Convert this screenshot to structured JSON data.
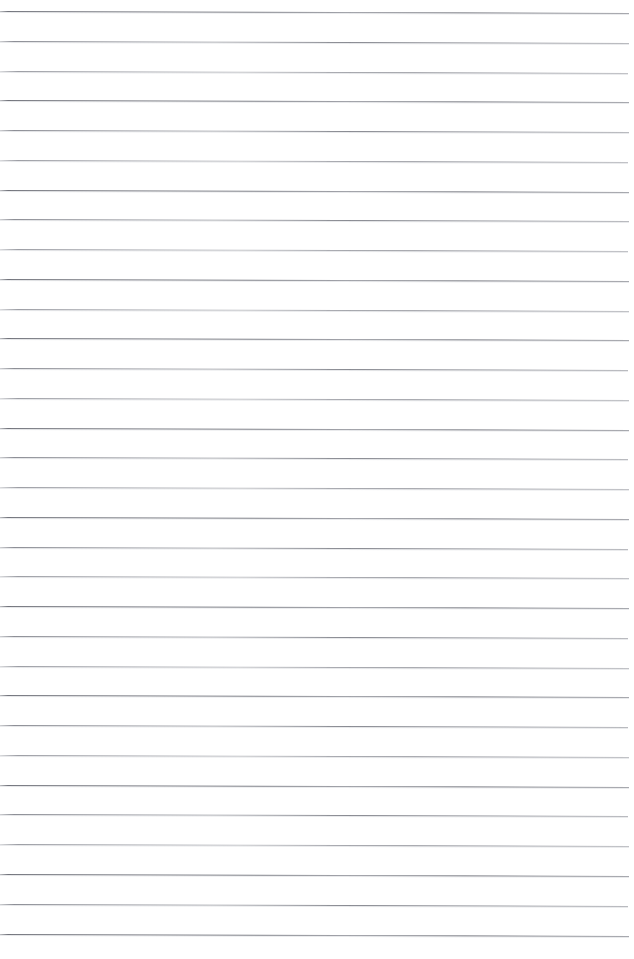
{
  "page": {
    "kind": "lined-paper-scan",
    "width": 634,
    "height": 959,
    "background_color": "#ffffff",
    "has_text": false,
    "note": ""
  },
  "ruling": {
    "line_color": "#808289",
    "line_count": 32,
    "spacing_px": 30,
    "first_line_y": 11,
    "last_line_y": 949,
    "line_start_x": 0,
    "line_end_x": 629,
    "line_thickness_px": 1,
    "tilt_px_across_width": 2,
    "lines": [
      {
        "y": 11,
        "x_start": 0,
        "x_end": 629,
        "variant": "var-b"
      },
      {
        "y": 41,
        "x_start": 0,
        "x_end": 629,
        "variant": "var-a"
      },
      {
        "y": 71,
        "x_start": 0,
        "x_end": 628,
        "variant": "var-c"
      },
      {
        "y": 100,
        "x_start": 0,
        "x_end": 629,
        "variant": "var-b"
      },
      {
        "y": 130,
        "x_start": 0,
        "x_end": 629,
        "variant": "var-a"
      },
      {
        "y": 160,
        "x_start": 0,
        "x_end": 628,
        "variant": "var-c"
      },
      {
        "y": 190,
        "x_start": 0,
        "x_end": 629,
        "variant": "var-b"
      },
      {
        "y": 219,
        "x_start": 0,
        "x_end": 629,
        "variant": "var-a"
      },
      {
        "y": 249,
        "x_start": 0,
        "x_end": 628,
        "variant": "var-c"
      },
      {
        "y": 279,
        "x_start": 0,
        "x_end": 629,
        "variant": "var-b"
      },
      {
        "y": 309,
        "x_start": 0,
        "x_end": 629,
        "variant": "var-c"
      },
      {
        "y": 338,
        "x_start": 0,
        "x_end": 629,
        "variant": "var-b"
      },
      {
        "y": 368,
        "x_start": 0,
        "x_end": 628,
        "variant": "var-a"
      },
      {
        "y": 398,
        "x_start": 0,
        "x_end": 629,
        "variant": "var-c"
      },
      {
        "y": 428,
        "x_start": 0,
        "x_end": 629,
        "variant": "var-b"
      },
      {
        "y": 457,
        "x_start": 0,
        "x_end": 628,
        "variant": "var-a"
      },
      {
        "y": 487,
        "x_start": 0,
        "x_end": 629,
        "variant": "var-c"
      },
      {
        "y": 517,
        "x_start": 0,
        "x_end": 629,
        "variant": "var-b"
      },
      {
        "y": 547,
        "x_start": 0,
        "x_end": 628,
        "variant": "var-a"
      },
      {
        "y": 576,
        "x_start": 0,
        "x_end": 629,
        "variant": "var-c"
      },
      {
        "y": 606,
        "x_start": 0,
        "x_end": 629,
        "variant": "var-b"
      },
      {
        "y": 636,
        "x_start": 0,
        "x_end": 628,
        "variant": "var-a"
      },
      {
        "y": 666,
        "x_start": 0,
        "x_end": 629,
        "variant": "var-c"
      },
      {
        "y": 695,
        "x_start": 0,
        "x_end": 629,
        "variant": "var-b"
      },
      {
        "y": 725,
        "x_start": 0,
        "x_end": 628,
        "variant": "var-a"
      },
      {
        "y": 755,
        "x_start": 0,
        "x_end": 629,
        "variant": "var-c"
      },
      {
        "y": 785,
        "x_start": 0,
        "x_end": 629,
        "variant": "var-b"
      },
      {
        "y": 814,
        "x_start": 0,
        "x_end": 628,
        "variant": "var-a"
      },
      {
        "y": 844,
        "x_start": 0,
        "x_end": 629,
        "variant": "var-c"
      },
      {
        "y": 874,
        "x_start": 0,
        "x_end": 629,
        "variant": "var-b"
      },
      {
        "y": 904,
        "x_start": 0,
        "x_end": 628,
        "variant": "var-a"
      },
      {
        "y": 934,
        "x_start": 0,
        "x_end": 629,
        "variant": "var-b"
      }
    ]
  }
}
